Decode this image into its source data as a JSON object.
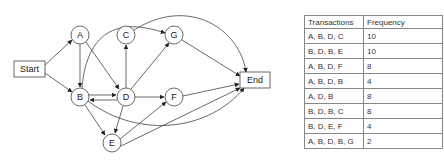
{
  "diagram": {
    "nodes": [
      {
        "id": "start",
        "label": "Start",
        "shape": "box"
      },
      {
        "id": "A",
        "label": "A",
        "shape": "circle"
      },
      {
        "id": "B",
        "label": "B",
        "shape": "circle"
      },
      {
        "id": "C",
        "label": "C",
        "shape": "circle"
      },
      {
        "id": "D",
        "label": "D",
        "shape": "circle"
      },
      {
        "id": "E",
        "label": "E",
        "shape": "circle"
      },
      {
        "id": "F",
        "label": "F",
        "shape": "circle"
      },
      {
        "id": "G",
        "label": "G",
        "shape": "circle"
      },
      {
        "id": "end",
        "label": "End",
        "shape": "box"
      }
    ],
    "edges": [
      [
        "Start",
        "A"
      ],
      [
        "Start",
        "B"
      ],
      [
        "A",
        "B"
      ],
      [
        "A",
        "D"
      ],
      [
        "B",
        "D"
      ],
      [
        "D",
        "B"
      ],
      [
        "D",
        "C"
      ],
      [
        "D",
        "G"
      ],
      [
        "D",
        "F"
      ],
      [
        "D",
        "E"
      ],
      [
        "B",
        "E"
      ],
      [
        "B",
        "End"
      ],
      [
        "C",
        "G"
      ],
      [
        "G",
        "End"
      ],
      [
        "F",
        "End"
      ],
      [
        "E",
        "F"
      ],
      [
        "E",
        "End"
      ],
      [
        "B",
        "G"
      ],
      [
        "C",
        "End"
      ]
    ]
  },
  "table": {
    "headers": [
      "Transactions",
      "Frequency"
    ],
    "rows": [
      {
        "transactions": "A, B, D, C",
        "frequency": "10"
      },
      {
        "transactions": "B, D, B, E",
        "frequency": "10"
      },
      {
        "transactions": "A, B, D, F",
        "frequency": "8"
      },
      {
        "transactions": "A, B, D, B",
        "frequency": "4"
      },
      {
        "transactions": "A, D, B",
        "frequency": "8"
      },
      {
        "transactions": "B, D, B, C",
        "frequency": "8"
      },
      {
        "transactions": "B, D, E, F",
        "frequency": "4"
      },
      {
        "transactions": "A, B, D, B, G",
        "frequency": "2"
      }
    ]
  }
}
